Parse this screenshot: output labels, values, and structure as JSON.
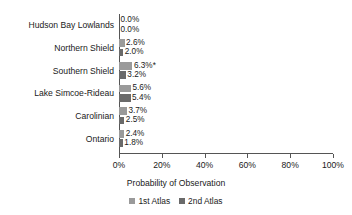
{
  "chart_data": {
    "type": "bar",
    "orientation": "horizontal",
    "title": "",
    "xlabel": "Probability of Observation",
    "ylabel": "",
    "xlim": [
      0,
      100
    ],
    "xticks": [
      "0%",
      "20%",
      "40%",
      "60%",
      "80%",
      "100%"
    ],
    "xtick_values": [
      0,
      20,
      40,
      60,
      80,
      100
    ],
    "grid": false,
    "legend_position": "bottom",
    "categories": [
      "Hudson Bay Lowlands",
      "Northern Shield",
      "Southern Shield",
      "Lake Simcoe-Rideau",
      "Carolinian",
      "Ontario"
    ],
    "series": [
      {
        "name": "1st Atlas",
        "color": "#9a9a9a",
        "values": [
          0.0,
          2.6,
          6.3,
          5.6,
          3.7,
          2.4
        ],
        "labels": [
          "0.0%",
          "2.6%",
          "6.3%*",
          "5.6%",
          "3.7%",
          "2.4%"
        ]
      },
      {
        "name": "2nd Atlas",
        "color": "#6a6a6a",
        "values": [
          0.0,
          2.0,
          3.2,
          5.4,
          2.5,
          1.8
        ],
        "labels": [
          "0.0%",
          "2.0%",
          "3.2%",
          "5.4%",
          "2.5%",
          "1.8%"
        ]
      }
    ],
    "annotations": [
      "* significance marker on Southern Shield 1st Atlas value"
    ]
  }
}
